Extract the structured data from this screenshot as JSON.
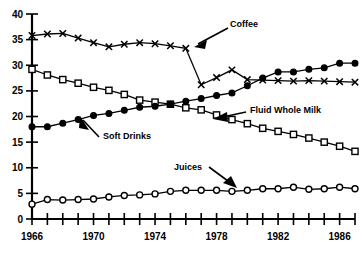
{
  "chart_data": {
    "type": "line",
    "title": "",
    "subtitle": "",
    "xlabel": "",
    "ylabel": "",
    "xlim": [
      1966,
      1987
    ],
    "ylim": [
      0,
      40
    ],
    "grid": false,
    "legend_position": "inline-annotations",
    "ytick_labels": [
      "0",
      "5",
      "10",
      "15",
      "20",
      "25",
      "30",
      "35",
      "40"
    ],
    "ytick_values": [
      0,
      5,
      10,
      15,
      20,
      25,
      30,
      35,
      40
    ],
    "xtick_values": [
      1966,
      1967,
      1968,
      1969,
      1970,
      1971,
      1972,
      1973,
      1974,
      1975,
      1976,
      1977,
      1978,
      1979,
      1980,
      1981,
      1982,
      1983,
      1984,
      1985,
      1986,
      1987
    ],
    "xtick_labels_shown": [
      "1966",
      "1970",
      "1974",
      "1978",
      "1982",
      "1986"
    ],
    "xtick_labeled_values": [
      1966,
      1970,
      1974,
      1978,
      1982,
      1986
    ],
    "x": [
      1966,
      1967,
      1968,
      1969,
      1970,
      1971,
      1972,
      1973,
      1974,
      1975,
      1976,
      1977,
      1978,
      1979,
      1980,
      1981,
      1982,
      1983,
      1984,
      1985,
      1986,
      1987
    ],
    "series": [
      {
        "name": "Coffee",
        "marker": "x",
        "values": [
          35.8,
          36.1,
          36.2,
          35.3,
          34.4,
          33.6,
          34.1,
          34.4,
          34.2,
          33.8,
          33.3,
          26.2,
          27.6,
          29.1,
          27.2,
          27.1,
          27.0,
          26.9,
          27.0,
          26.9,
          26.8,
          26.7
        ]
      },
      {
        "name": "Fluid Whole Milk",
        "marker": "square",
        "values": [
          29.2,
          28.1,
          27.2,
          26.5,
          25.7,
          25.1,
          24.3,
          23.2,
          22.8,
          22.4,
          21.7,
          21.3,
          20.3,
          19.4,
          18.6,
          17.7,
          17.1,
          16.5,
          15.8,
          15.0,
          14.2,
          13.2
        ]
      },
      {
        "name": "Soft Drinks",
        "marker": "circle-filled",
        "values": [
          18.0,
          18.0,
          18.7,
          19.4,
          20.2,
          20.6,
          21.2,
          21.8,
          22.0,
          22.4,
          23.0,
          23.5,
          24.1,
          24.6,
          26.0,
          27.5,
          28.7,
          28.7,
          29.2,
          29.5,
          30.4,
          30.4
        ]
      },
      {
        "name": "Juices",
        "marker": "circle-open",
        "values": [
          2.9,
          3.8,
          3.7,
          3.8,
          3.9,
          4.3,
          4.6,
          4.7,
          4.9,
          5.4,
          5.6,
          5.6,
          5.6,
          5.4,
          5.6,
          5.9,
          5.9,
          6.2,
          5.8,
          5.9,
          6.2,
          5.9
        ]
      }
    ],
    "annotations": [
      {
        "text": "Coffee",
        "x_px": 230,
        "y_px": 27
      },
      {
        "text": "Fluid Whole Milk",
        "x_px": 250,
        "y_px": 113
      },
      {
        "text": "Soft Drinks",
        "x_px": 103,
        "y_px": 139
      },
      {
        "text": "Juices",
        "x_px": 174,
        "y_px": 170
      }
    ]
  }
}
